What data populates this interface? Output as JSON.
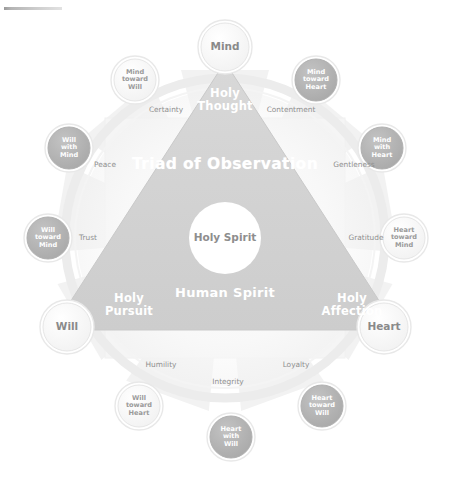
{
  "diagram": {
    "title": "Triad of Observation",
    "subtitle": "Human Spirit",
    "center_label": "Holy Spirit",
    "corner_mark": "",
    "colors": {
      "triangle_fill": "#d2d2d2",
      "node_dark_fill": "#b3b3b3",
      "node_light_fill": "#f4f4f4",
      "ring_stroke": "#e3e3e3",
      "petal_fill": "#f1f1f1",
      "square_fill": "#f6f6f6",
      "text_gray": "#8e8e8e",
      "text_white": "#ffffff",
      "background": "#ffffff"
    }
  },
  "primary_nodes": [
    {
      "id": "mind",
      "label": "Mind",
      "x": 225,
      "y": 47,
      "r": 24,
      "style": "light"
    },
    {
      "id": "will",
      "label": "Will",
      "x": 67,
      "y": 327,
      "r": 24,
      "style": "light"
    },
    {
      "id": "heart",
      "label": "Heart",
      "x": 384,
      "y": 327,
      "r": 24,
      "style": "light"
    }
  ],
  "triangle_edges": [
    {
      "id": "holy-thought",
      "label": "Holy\nThought",
      "x": 225,
      "y": 100
    },
    {
      "id": "holy-pursuit",
      "label": "Holy\nPursuit",
      "x": 129,
      "y": 305
    },
    {
      "id": "holy-affection",
      "label": "Holy\nAffection",
      "x": 352,
      "y": 305
    }
  ],
  "secondary_nodes": [
    {
      "id": "mind-toward-will",
      "label": "Mind\ntoward\nWill",
      "x": 135,
      "y": 80,
      "r": 21,
      "style": "light"
    },
    {
      "id": "mind-toward-heart",
      "label": "Mind\ntoward\nHeart",
      "x": 316,
      "y": 80,
      "r": 21,
      "style": "dark"
    },
    {
      "id": "will-with-mind",
      "label": "Will\nwith\nMind",
      "x": 69,
      "y": 148,
      "r": 21,
      "style": "dark"
    },
    {
      "id": "mind-with-heart",
      "label": "Mind\nwith\nHeart",
      "x": 382,
      "y": 148,
      "r": 21,
      "style": "dark"
    },
    {
      "id": "will-toward-mind",
      "label": "Will\ntoward\nMind",
      "x": 48,
      "y": 238,
      "r": 21,
      "style": "dark"
    },
    {
      "id": "heart-toward-mind",
      "label": "Heart\ntoward\nMind",
      "x": 404,
      "y": 238,
      "r": 21,
      "style": "light"
    },
    {
      "id": "will-toward-heart",
      "label": "Will\ntoward\nHeart",
      "x": 139,
      "y": 406,
      "r": 21,
      "style": "light"
    },
    {
      "id": "heart-toward-will",
      "label": "Heart\ntoward\nWill",
      "x": 322,
      "y": 406,
      "r": 21,
      "style": "dark"
    },
    {
      "id": "heart-with-will",
      "label": "Heart\nwith\nWill",
      "x": 231,
      "y": 437,
      "r": 21,
      "style": "dark"
    }
  ],
  "virtues": [
    {
      "id": "certainty",
      "label": "Certainty",
      "x": 166,
      "y": 110
    },
    {
      "id": "contentment",
      "label": "Contentment",
      "x": 291,
      "y": 110
    },
    {
      "id": "peace",
      "label": "Peace",
      "x": 105,
      "y": 165
    },
    {
      "id": "gentleness",
      "label": "Gentleness",
      "x": 354,
      "y": 165
    },
    {
      "id": "trust",
      "label": "Trust",
      "x": 88,
      "y": 238
    },
    {
      "id": "gratitude",
      "label": "Gratitude",
      "x": 366,
      "y": 238
    },
    {
      "id": "humility",
      "label": "Humility",
      "x": 161,
      "y": 365
    },
    {
      "id": "loyalty",
      "label": "Loyalty",
      "x": 296,
      "y": 365
    },
    {
      "id": "integrity",
      "label": "Integrity",
      "x": 228,
      "y": 382
    }
  ]
}
